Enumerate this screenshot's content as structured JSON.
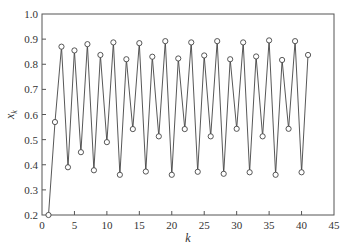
{
  "chart_data": {
    "type": "line",
    "title": "",
    "xlabel": "k",
    "ylabel": "x_k",
    "ylabel_main": "x",
    "ylabel_sub": "k",
    "xlim": [
      0,
      45
    ],
    "ylim": [
      0.2,
      1.0
    ],
    "xticks": [
      0,
      5,
      10,
      15,
      20,
      25,
      30,
      35,
      40,
      45
    ],
    "yticks": [
      0.2,
      0.3,
      0.4,
      0.5,
      0.6,
      0.7,
      0.8,
      0.9,
      1.0
    ],
    "xtick_labels": [
      "0",
      "5",
      "10",
      "15",
      "20",
      "25",
      "30",
      "35",
      "40",
      "45"
    ],
    "ytick_labels": [
      "0.2",
      "0.3",
      "0.4",
      "0.5",
      "0.6",
      "0.7",
      "0.8",
      "0.9",
      "1.0"
    ],
    "grid": false,
    "legend": null,
    "marker": "open-circle",
    "colors": {
      "line": "#444444",
      "marker": "#444444",
      "axis": "#555555",
      "text": "#333333"
    },
    "series": [
      {
        "name": "x_k",
        "x": [
          1,
          2,
          3,
          4,
          5,
          6,
          7,
          8,
          9,
          10,
          11,
          12,
          13,
          14,
          15,
          16,
          17,
          18,
          19,
          20,
          21,
          22,
          23,
          24,
          25,
          26,
          27,
          28,
          29,
          30,
          31,
          32,
          33,
          34,
          35,
          36,
          37,
          38,
          39,
          40,
          41
        ],
        "values": [
          0.2,
          0.57,
          0.87,
          0.39,
          0.855,
          0.45,
          0.88,
          0.378,
          0.837,
          0.49,
          0.887,
          0.36,
          0.82,
          0.542,
          0.884,
          0.373,
          0.83,
          0.513,
          0.892,
          0.36,
          0.823,
          0.542,
          0.887,
          0.372,
          0.835,
          0.513,
          0.892,
          0.364,
          0.82,
          0.543,
          0.887,
          0.37,
          0.831,
          0.513,
          0.895,
          0.36,
          0.817,
          0.543,
          0.892,
          0.37,
          0.837
        ]
      }
    ]
  }
}
